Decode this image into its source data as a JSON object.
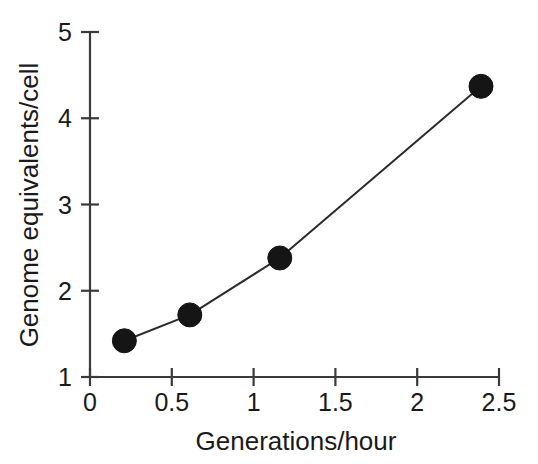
{
  "chart_data": {
    "type": "line",
    "title": "",
    "xlabel": "Generations/hour",
    "ylabel": "Genome equivalents/cell",
    "xlim": [
      0,
      2.5
    ],
    "ylim": [
      1,
      5
    ],
    "xticks": [
      "0",
      "0.5",
      "1",
      "1.5",
      "2",
      "2.5"
    ],
    "xtick_values": [
      0,
      0.5,
      1,
      1.5,
      2,
      2.5
    ],
    "yticks": [
      "1",
      "2",
      "3",
      "4",
      "5"
    ],
    "ytick_values": [
      1,
      2,
      3,
      4,
      5
    ],
    "grid": false,
    "legend": null,
    "marker": "filled-circle",
    "series": [
      {
        "name": "Genome equivalents per cell",
        "x": [
          0.21,
          0.61,
          1.16,
          2.39
        ],
        "y": [
          1.42,
          1.72,
          2.38,
          4.37
        ]
      }
    ],
    "colors": {
      "line": "#2b2b2b",
      "marker": "#151515",
      "axis": "#3a3a3a",
      "background": "#ffffff",
      "text": "#1a1a1a"
    }
  }
}
